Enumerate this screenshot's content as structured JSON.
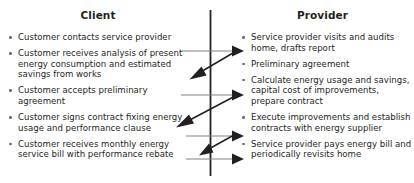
{
  "diagram": {
    "divider": {
      "name": "center-axis",
      "color": "#231f20"
    },
    "colors": {
      "text": "#231f20",
      "bullet": "#6d6e71",
      "arrow_to_provider": "#808285",
      "arrow_to_client": "#231f20",
      "background": "#ffffff"
    }
  },
  "columns": {
    "client": {
      "title": "Client",
      "items": [
        "Customer contacts service provider",
        "Customer receives analysis of present energy consumption and estimated savings from works",
        "Customer accepts preliminary agreement",
        "Customer signs contract fixing energy usage and performance clause",
        "Customer receives monthly energy service bill with performance rebate"
      ]
    },
    "provider": {
      "title": "Provider",
      "items": [
        "Service provider visits and audits home, drafts report",
        "Preliminary agreement",
        "Calculate energy usage and savings, capital cost of improvements, prepare contract",
        "Execute improvements and establish contracts with energy supplier",
        "Service provider pays energy bill and periodically revisits home"
      ]
    }
  },
  "flows": {
    "to_provider": [
      {
        "name": "client-contacts-provider-arrow",
        "direction": "right"
      },
      {
        "name": "client-accepts-preliminary-agreement-arrow",
        "direction": "right"
      },
      {
        "name": "client-signs-contract-arrow",
        "direction": "right"
      },
      {
        "name": "client-receives-bill-arrow",
        "direction": "right"
      }
    ],
    "to_client": [
      {
        "name": "provider-delivers-report-arrow",
        "direction": "down-left"
      },
      {
        "name": "provider-delivers-contract-arrow",
        "direction": "down-left"
      },
      {
        "name": "provider-executes-improvements-arrow",
        "direction": "down-left"
      }
    ]
  }
}
